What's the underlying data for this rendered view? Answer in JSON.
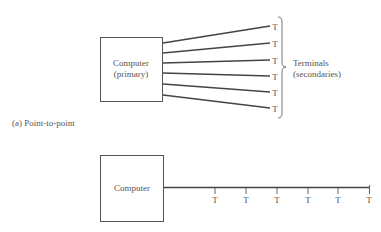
{
  "diagram_a": {
    "computer_label_line1": "Computer",
    "computer_label_line2": "(primary)",
    "terminal_label": "T",
    "terminals": [
      "T",
      "T",
      "T",
      "T",
      "T",
      "T"
    ],
    "group_label_line1": "Terminals",
    "group_label_line2": "(secondaries)",
    "caption": "(a) Point-to-point"
  },
  "diagram_b": {
    "computer_label": "Computer",
    "terminals": [
      "T",
      "T",
      "T",
      "T",
      "T",
      "T"
    ]
  },
  "colors": {
    "line": "#444444",
    "box": "#555555",
    "text": "#555555"
  }
}
